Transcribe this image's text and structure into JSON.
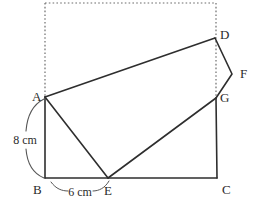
{
  "figure": {
    "background_color": "#ffffff",
    "line_color": "#2e2e2e",
    "dotted_color": "#6d6d6d",
    "brace_color": "#575757",
    "text_color": "#2b2b2b",
    "vertices": {
      "A": {
        "label": "A",
        "x": 45,
        "y": 97,
        "label_x": 32,
        "label_y": 101
      },
      "B": {
        "label": "B",
        "x": 45,
        "y": 178,
        "label_x": 33,
        "label_y": 193
      },
      "C": {
        "label": "C",
        "x": 217,
        "y": 178,
        "label_x": 222,
        "label_y": 193
      },
      "D": {
        "label": "D",
        "x": 215,
        "y": 38,
        "label_x": 220,
        "label_y": 37
      },
      "E": {
        "label": "E",
        "x": 108,
        "y": 178,
        "label_x": 104,
        "label_y": 194
      },
      "F": {
        "label": "F",
        "x": 232,
        "y": 74,
        "label_x": 240,
        "label_y": 76
      },
      "G": {
        "label": "G",
        "x": 216,
        "y": 98,
        "label_x": 220,
        "label_y": 101
      }
    },
    "dimensions": [
      {
        "id": "height",
        "label": "8 cm",
        "label_x": 25,
        "label_y": 140,
        "measures": "A to B"
      },
      {
        "id": "base",
        "label": "6 cm",
        "label_x": 80,
        "label_y": 192,
        "measures": "B to E"
      }
    ],
    "solid_paths": [
      {
        "id": "path-bc",
        "name": "segment-b-c",
        "points": "45,178 217,178"
      },
      {
        "id": "path-ab",
        "name": "segment-a-b",
        "points": "45,97 45,178"
      },
      {
        "id": "path-gc",
        "name": "segment-g-c",
        "points": "216,98 217,178"
      },
      {
        "id": "path-ad",
        "name": "segment-a-d",
        "points": "45,97 215,38"
      },
      {
        "id": "path-dfg",
        "name": "segment-d-f-g",
        "points": "215,38 232,74 216,98"
      },
      {
        "id": "path-eg",
        "name": "segment-e-g",
        "points": "108,178 216,98"
      },
      {
        "id": "path-ae",
        "name": "segment-a-e",
        "points": "45,97 108,178"
      }
    ],
    "dotted_paths": [
      {
        "id": "dot-top",
        "name": "dotted-top-edge",
        "points": "45,3 216,3"
      },
      {
        "id": "dot-left",
        "name": "dotted-left-edge",
        "points": "45,3 45,97"
      },
      {
        "id": "dot-right",
        "name": "dotted-right-edge",
        "points": "216,3 216,98"
      }
    ],
    "braces": [
      {
        "id": "brace-upper",
        "name": "height-brace-upper",
        "d": "M 44,99 C 32,105 27,118 26,131"
      },
      {
        "id": "brace-lower",
        "name": "height-brace-lower",
        "d": "M 26,149 C 27,162 32,173 44,178"
      },
      {
        "id": "tick-left",
        "name": "base-tick-left",
        "d": "M 51,182 C 56,189 62,191 68,191"
      },
      {
        "id": "tick-right",
        "name": "base-tick-right",
        "d": "M 93,191 C 99,191 105,188 109,181"
      }
    ]
  }
}
